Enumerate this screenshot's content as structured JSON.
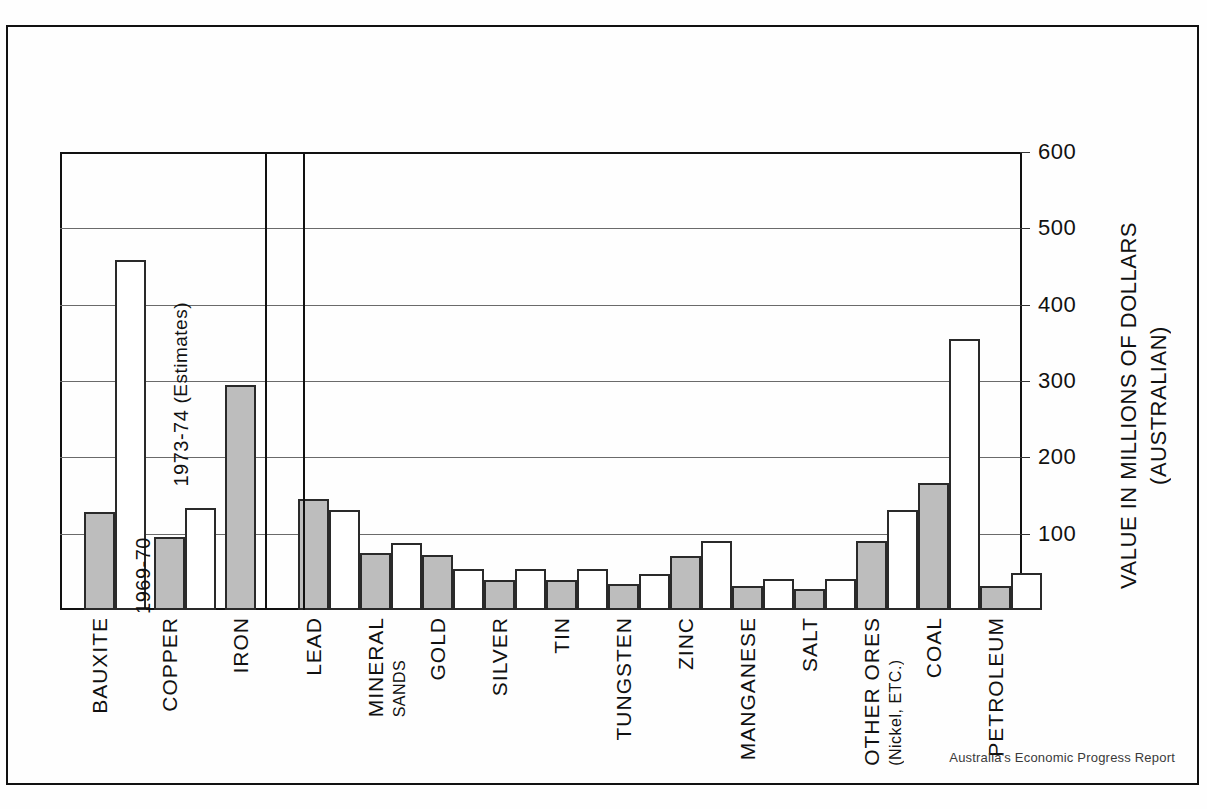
{
  "footer": {
    "credit": "Australia's Economic Progress Report"
  },
  "legend": {
    "series1": "1969-70",
    "series2_line1": "1973-74",
    "series2_line2": "(Estimates)"
  },
  "axis": {
    "y_title_line1": "VALUE IN MILLIONS OF DOLLARS",
    "y_title_line2": "(AUSTRALIAN)",
    "y_ticks": [
      "600",
      "500",
      "400",
      "300",
      "200",
      "100"
    ]
  },
  "chart_data": {
    "type": "bar",
    "title": "",
    "subtitle": "",
    "xlabel": "",
    "ylabel": "VALUE IN MILLIONS OF DOLLARS (AUSTRALIAN)",
    "ylim": [
      0,
      600
    ],
    "yticks": [
      100,
      200,
      300,
      400,
      500,
      600
    ],
    "grid": true,
    "legend_position": "inside-plot-annotations",
    "categories": [
      "BAUXITE",
      "COPPER",
      "IRON",
      "LEAD",
      "MINERAL SANDS",
      "GOLD",
      "SILVER",
      "TIN",
      "TUNGSTEN",
      "ZINC",
      "MANGANESE",
      "SALT",
      "OTHER ORES (Nickel, ETC.)",
      "COAL",
      "PETROLEUM"
    ],
    "category_labels": [
      {
        "main": "BAUXITE",
        "sub": ""
      },
      {
        "main": "COPPER",
        "sub": ""
      },
      {
        "main": "IRON",
        "sub": ""
      },
      {
        "main": "LEAD",
        "sub": ""
      },
      {
        "main": "MINERAL",
        "sub": "SANDS"
      },
      {
        "main": "GOLD",
        "sub": ""
      },
      {
        "main": "SILVER",
        "sub": ""
      },
      {
        "main": "TIN",
        "sub": ""
      },
      {
        "main": "TUNGSTEN",
        "sub": ""
      },
      {
        "main": "ZINC",
        "sub": ""
      },
      {
        "main": "MANGANESE",
        "sub": ""
      },
      {
        "main": "SALT",
        "sub": ""
      },
      {
        "main": "OTHER ORES",
        "sub": "(Nickel, ETC.)"
      },
      {
        "main": "COAL",
        "sub": ""
      },
      {
        "main": "PETROLEUM",
        "sub": ""
      }
    ],
    "series": [
      {
        "name": "1969-70",
        "color": "#bdbdbd",
        "values": [
          128,
          95,
          295,
          146,
          75,
          72,
          39,
          39,
          34,
          71,
          31,
          28,
          90,
          166,
          32
        ]
      },
      {
        "name": "1973-74 (Estimates)",
        "color": "#ffffff",
        "values": [
          458,
          134,
          null,
          131,
          88,
          54,
          54,
          54,
          47,
          90,
          41,
          41,
          131,
          355,
          48
        ]
      }
    ]
  }
}
